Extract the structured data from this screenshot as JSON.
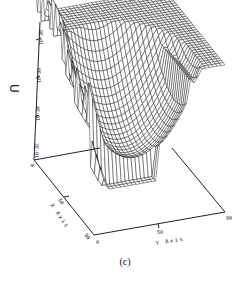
{
  "chart_data": {
    "type": "surface3d",
    "title": "",
    "caption": "(c)",
    "xlabel": "X Axis",
    "ylabel": "Y Axis",
    "zlabel": "U",
    "x_ticks": [
      "0",
      "50",
      "99"
    ],
    "y_ticks": [
      "0",
      "50",
      "99"
    ],
    "z_ticks": [
      "2E-01",
      "4E-01",
      "6E-01",
      "8E-01"
    ],
    "x_range": [
      0,
      99
    ],
    "y_range": [
      0,
      99
    ],
    "z_range": [
      0,
      0.85
    ],
    "grid": false,
    "legend": null,
    "style": "wireframe mesh, black lines on white"
  },
  "caption": "(c)"
}
